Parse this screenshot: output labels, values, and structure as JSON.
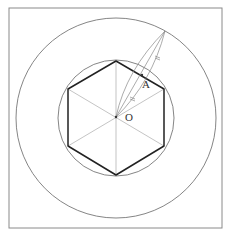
{
  "diagram": {
    "title": "",
    "labels": {
      "center": "O",
      "point": "A"
    },
    "frame": {
      "x": 9,
      "y": 8,
      "width": 213,
      "height": 220
    },
    "center": {
      "x": 116,
      "y": 117
    },
    "outer_circle_radius": 100,
    "inner_circle_radius": 58,
    "hexagon_circumradius": 56,
    "colors": {
      "frame": "#8a8a8a",
      "circle": "#777777",
      "hexagon": "#222222",
      "spoke": "#aaaaaa",
      "construction": "#888888",
      "label": "#333333"
    }
  }
}
